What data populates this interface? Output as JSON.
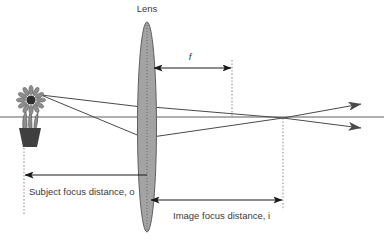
{
  "diagram": {
    "title_label": "Lens",
    "focal_label": "f",
    "subject_distance_label": "Subject focus distance, o",
    "image_distance_label": "Image focus distance, i",
    "colors": {
      "lens_fill": "#a3a3a3",
      "lens_stroke": "#5e5e5e",
      "ray_stroke": "#4a4a4a",
      "dimension_stroke": "#1a1a1a",
      "guide_stroke": "#8c8c8c",
      "text_fill": "#3a3a3a",
      "background": "#ffffff",
      "plant_dark": "#3f3f3f",
      "plant_mid": "#8d8d8d"
    },
    "geometry": {
      "optical_axis_y": 117,
      "lens_center_x": 147,
      "lens_half_width": 9,
      "lens_top_y": 22,
      "lens_bottom_y": 232,
      "focal_point_x": 232,
      "image_point_x": 283,
      "subject_plane_x": 24,
      "object_top_y": 97,
      "object_base_y": 147,
      "ray_exit_arrow_x": 372
    }
  }
}
